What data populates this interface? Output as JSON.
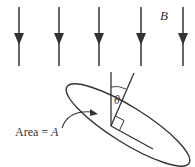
{
  "diagram": {
    "field_label": "B",
    "angle_label": "θ",
    "area_label_prefix": "Area = ",
    "area_label_var": "A",
    "colors": {
      "stroke": "#333333",
      "background": "#ffffff"
    },
    "field_arrows": [
      {
        "x": 19
      },
      {
        "x": 59
      },
      {
        "x": 99
      },
      {
        "x": 141
      },
      {
        "x": 183
      }
    ]
  }
}
